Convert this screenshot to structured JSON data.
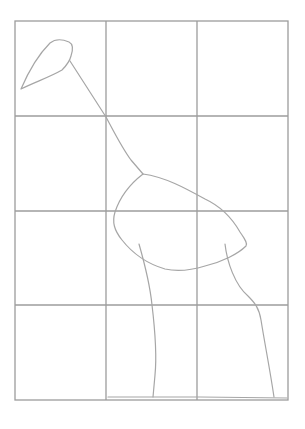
{
  "drawing": {
    "subject": "pencil sketch of a long-legged bird on a grid",
    "colors": {
      "background": "#ffffff",
      "grid": "#9c9c9c",
      "sketch": "#a6a6a6"
    },
    "grid": {
      "x": [
        15,
        106,
        197,
        288
      ],
      "y": [
        21,
        116,
        211,
        305,
        400
      ],
      "columns": 3,
      "rows": 4
    },
    "parts": [
      "head",
      "neck",
      "body",
      "left-leg",
      "right-leg",
      "ground-line"
    ]
  }
}
